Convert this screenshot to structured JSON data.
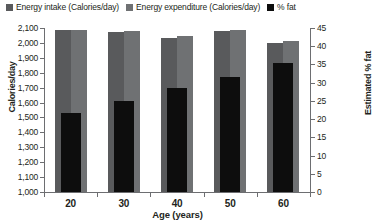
{
  "legend": {
    "items": [
      {
        "label": "Energy intake (Calories/day)",
        "color": "#595a5c",
        "name": "legend-energy-intake"
      },
      {
        "label": "Energy expenditure (Calories/day)",
        "color": "#6f7173",
        "name": "legend-energy-expenditure"
      },
      {
        "label": "% fat",
        "color": "#0d0d0d",
        "name": "legend-percent-fat"
      }
    ]
  },
  "axes": {
    "left": {
      "title": "Calories/day",
      "ticks": [
        "2,100",
        "2,000",
        "1,900",
        "1,800",
        "1,700",
        "1,600",
        "1,500",
        "1,400",
        "1,300",
        "1,200",
        "1,100",
        "1,000"
      ],
      "min": 1000,
      "max": 2100,
      "step": 100
    },
    "right": {
      "title": "Estimated % fat",
      "ticks": [
        "45",
        "40",
        "35",
        "30",
        "25",
        "20",
        "15",
        "10",
        "5",
        "0"
      ],
      "min": 0,
      "max": 45,
      "step": 5
    },
    "bottom": {
      "title": "Age (years)",
      "ticks": [
        "20",
        "30",
        "40",
        "50",
        "60"
      ]
    }
  },
  "chart_data": {
    "type": "bar",
    "title": "",
    "xlabel": "Age (years)",
    "ylabel": "Calories/day",
    "y2label": "Estimated % fat",
    "categories": [
      "20",
      "30",
      "40",
      "50",
      "60"
    ],
    "ylim": [
      1000,
      2100
    ],
    "y2lim": [
      0,
      45
    ],
    "grid": false,
    "legend_position": "top",
    "series": [
      {
        "name": "Energy intake (Calories/day)",
        "axis": "left",
        "color": "#595a5c",
        "values": [
          2085,
          2075,
          2035,
          2080,
          2000
        ]
      },
      {
        "name": "Energy expenditure (Calories/day)",
        "axis": "left",
        "color": "#6f7173",
        "values": [
          2085,
          2080,
          2045,
          2085,
          2010
        ]
      },
      {
        "name": "% fat",
        "axis": "right",
        "color": "#0d0d0d",
        "values": [
          21.7,
          25.0,
          28.5,
          31.5,
          35.4
        ]
      }
    ]
  }
}
